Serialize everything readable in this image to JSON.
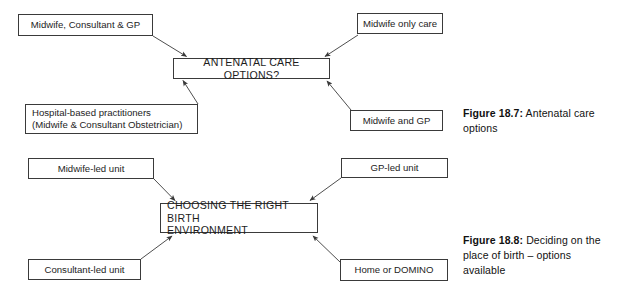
{
  "page": {
    "background_color": "#ffffff",
    "line_color": "#3a3a3a",
    "text_color": "#1d1d1d",
    "width": 621,
    "height": 299
  },
  "figures": [
    {
      "id": "figure-18-7",
      "hub": {
        "label": "ANTENATAL CARE OPTIONS?"
      },
      "nodes": [
        {
          "id": "midwife-consultant-gp",
          "label": "Midwife, Consultant & GP"
        },
        {
          "id": "midwife-only-care",
          "label": "Midwife only care"
        },
        {
          "id": "hospital-based-practitioners",
          "label": "Hospital-based practitioners\n(Midwife & Consultant Obstetrician)"
        },
        {
          "id": "midwife-and-gp",
          "label": "Midwife and GP"
        }
      ],
      "caption": {
        "label": "Figure 18.7:",
        "text": "Antenatal care options"
      }
    },
    {
      "id": "figure-18-8",
      "hub": {
        "label": "CHOOSING THE RIGHT BIRTH\nENVIRONMENT"
      },
      "nodes": [
        {
          "id": "midwife-led-unit",
          "label": "Midwife-led unit"
        },
        {
          "id": "gp-led-unit",
          "label": "GP-led unit"
        },
        {
          "id": "consultant-led-unit",
          "label": "Consultant-led unit"
        },
        {
          "id": "home-or-domino",
          "label": "Home or DOMINO"
        }
      ],
      "caption": {
        "label": "Figure 18.8:",
        "text": "Deciding on the place of birth – options available"
      }
    }
  ]
}
